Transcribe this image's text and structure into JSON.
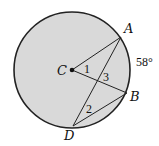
{
  "diagram": {
    "type": "circle-geometry",
    "circle": {
      "center_label": "C",
      "fill": "#d9d9d9",
      "stroke": "#222222"
    },
    "points": {
      "A": "A",
      "B": "B",
      "C": "C",
      "D": "D"
    },
    "arc_label": "58°",
    "angle_labels": {
      "angle1": "1",
      "angle2": "2",
      "angle3": "3"
    },
    "segments": [
      "CA",
      "CB",
      "AD",
      "BD"
    ]
  }
}
